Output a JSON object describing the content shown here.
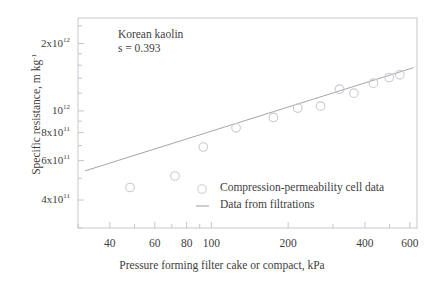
{
  "chart_data": {
    "type": "scatter",
    "title": "",
    "xlabel": "Pressure forming filter cake or compact, kPa",
    "ylabel": "Specific resistance, m kg⁻¹",
    "xscale": "log",
    "yscale": "log",
    "xlim": [
      30,
      640
    ],
    "ylim": [
      300000000000,
      2600000000000
    ],
    "grid": false,
    "xticks": [
      {
        "value": 40,
        "label": "40"
      },
      {
        "value": 60,
        "label": "60"
      },
      {
        "value": 80,
        "label": "80"
      },
      {
        "value": 100,
        "label": "100"
      },
      {
        "value": 200,
        "label": "200"
      },
      {
        "value": 400,
        "label": "400"
      },
      {
        "value": 600,
        "label": "600"
      }
    ],
    "xminor": [
      30,
      50,
      70,
      90,
      300,
      500
    ],
    "yticks": [
      {
        "value": 2000000000000,
        "label": "2x10",
        "exp": "12"
      },
      {
        "value": 1000000000000,
        "label": "10",
        "exp": "12"
      },
      {
        "value": 800000000000,
        "label": "8x10",
        "exp": "11"
      },
      {
        "value": 600000000000,
        "label": "6x10",
        "exp": "11"
      },
      {
        "value": 400000000000,
        "label": "4x10",
        "exp": "11"
      }
    ],
    "yminor": [
      300000000000,
      500000000000,
      700000000000,
      900000000000,
      1200000000000,
      1400000000000,
      1600000000000,
      1800000000000,
      2400000000000
    ],
    "annotations": [
      {
        "text": "Korean kaolin",
        "x": 43,
        "y": 2150000000000
      },
      {
        "text": "s = 0.393",
        "x": 43,
        "y": 1870000000000
      }
    ],
    "legend": {
      "position": "lower-right-inside",
      "entries": [
        {
          "label": "Compression-permeability cell data",
          "marker": "circle-open",
          "color": "#cfcfd6"
        },
        {
          "label": "Data from filtrations",
          "marker": "line",
          "color": "#8f8f99"
        }
      ]
    },
    "series": [
      {
        "name": "Compression-permeability cell data",
        "marker": "circle-open",
        "color": "#c9c9d2",
        "points": [
          {
            "x": 48,
            "y": 455000000000
          },
          {
            "x": 72,
            "y": 512000000000
          },
          {
            "x": 93,
            "y": 690000000000
          },
          {
            "x": 125,
            "y": 840000000000
          },
          {
            "x": 175,
            "y": 935000000000
          },
          {
            "x": 218,
            "y": 1030000000000
          },
          {
            "x": 268,
            "y": 1050000000000
          },
          {
            "x": 318,
            "y": 1250000000000
          },
          {
            "x": 362,
            "y": 1200000000000
          },
          {
            "x": 432,
            "y": 1330000000000
          },
          {
            "x": 498,
            "y": 1410000000000
          },
          {
            "x": 548,
            "y": 1450000000000
          }
        ]
      },
      {
        "name": "Data from filtrations",
        "marker": "line",
        "color": "#9a9aa3",
        "fit": {
          "slope_s": 0.393,
          "x_start": 32,
          "y_start": 540000000000,
          "x_end": 620,
          "y_end": 1560000000000
        }
      }
    ]
  },
  "axis_titles": {
    "x": "Pressure forming filter cake or compact, kPa",
    "y_main": "Specific resistance, m kg",
    "y_exp": "-1"
  }
}
